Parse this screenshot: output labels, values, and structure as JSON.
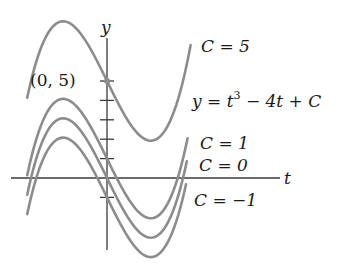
{
  "figure": {
    "equation": {
      "prefix": "y = t",
      "exponent": "3",
      "suffix": " − 4t + C"
    },
    "axes": {
      "x_label": "t",
      "y_label": "y"
    },
    "point_label": "(0, 5)",
    "curve_labels": [
      {
        "C": 5,
        "text": "C = 5"
      },
      {
        "C": 1,
        "text": "C = 1"
      },
      {
        "C": 0,
        "text": "C = 0"
      },
      {
        "C": -1,
        "text": "C = −1"
      }
    ],
    "colors": {
      "curve": "#8c8c8c",
      "axis": "#3a3a3a",
      "text": "#1a1a1a"
    }
  },
  "chart_data": {
    "type": "line",
    "title": "",
    "function": "y = t^3 - 4t + C",
    "xlabel": "t",
    "ylabel": "y",
    "y_ticks": [
      -1,
      1,
      2,
      3,
      4,
      5
    ],
    "marked_point": {
      "t": 0,
      "y": 5,
      "label": "(0, 5)"
    },
    "series": [
      {
        "name": "C = 5",
        "C": 5,
        "t_range": [
          -2.1,
          2.2
        ]
      },
      {
        "name": "C = 1",
        "C": 1,
        "t_range": [
          -2.1,
          2.12
        ]
      },
      {
        "name": "C = 0",
        "C": 0,
        "t_range": [
          -2.1,
          2.1
        ]
      },
      {
        "name": "C = -1",
        "C": -1,
        "t_range": [
          -2.1,
          2.08
        ]
      }
    ],
    "critical_points": {
      "t_max": -1.155,
      "t_min": 1.155,
      "offset": 3.079
    },
    "grid": false
  },
  "layout": {
    "origin_px": [
      107,
      178
    ],
    "px_per_t": 38,
    "px_per_y": 19.4
  }
}
